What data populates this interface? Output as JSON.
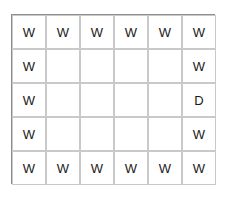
{
  "figure": {
    "background_color": "#ffffff",
    "frame": {
      "border_color": "#8e8e8e",
      "x": 11,
      "y": 14,
      "width": 204,
      "height": 170
    },
    "grid": {
      "columns": 6,
      "rows": 5,
      "cell_width": 34,
      "cell_height": 34,
      "line_color": "#c9c9c9"
    },
    "cells": [
      {
        "row": 0,
        "col": 0,
        "label": "W"
      },
      {
        "row": 0,
        "col": 1,
        "label": "W"
      },
      {
        "row": 0,
        "col": 2,
        "label": "W"
      },
      {
        "row": 0,
        "col": 3,
        "label": "W"
      },
      {
        "row": 0,
        "col": 4,
        "label": "W"
      },
      {
        "row": 0,
        "col": 5,
        "label": "W"
      },
      {
        "row": 1,
        "col": 0,
        "label": "W"
      },
      {
        "row": 1,
        "col": 1,
        "label": ""
      },
      {
        "row": 1,
        "col": 2,
        "label": ""
      },
      {
        "row": 1,
        "col": 3,
        "label": ""
      },
      {
        "row": 1,
        "col": 4,
        "label": ""
      },
      {
        "row": 1,
        "col": 5,
        "label": "W"
      },
      {
        "row": 2,
        "col": 0,
        "label": "W"
      },
      {
        "row": 2,
        "col": 1,
        "label": ""
      },
      {
        "row": 2,
        "col": 2,
        "label": ""
      },
      {
        "row": 2,
        "col": 3,
        "label": ""
      },
      {
        "row": 2,
        "col": 4,
        "label": ""
      },
      {
        "row": 2,
        "col": 5,
        "label": "D"
      },
      {
        "row": 3,
        "col": 0,
        "label": "W"
      },
      {
        "row": 3,
        "col": 1,
        "label": ""
      },
      {
        "row": 3,
        "col": 2,
        "label": ""
      },
      {
        "row": 3,
        "col": 3,
        "label": ""
      },
      {
        "row": 3,
        "col": 4,
        "label": ""
      },
      {
        "row": 3,
        "col": 5,
        "label": "W"
      },
      {
        "row": 4,
        "col": 0,
        "label": "W"
      },
      {
        "row": 4,
        "col": 1,
        "label": "W"
      },
      {
        "row": 4,
        "col": 2,
        "label": "W"
      },
      {
        "row": 4,
        "col": 3,
        "label": "W"
      },
      {
        "row": 4,
        "col": 4,
        "label": "W"
      },
      {
        "row": 4,
        "col": 5,
        "label": "W"
      }
    ],
    "wedge": {
      "name": "gradient-wedge",
      "description": "left-pointing shaded wedge",
      "tip_x": 92,
      "tip_y": 99,
      "top_x": 181,
      "top_y": 46,
      "bottom_x": 181,
      "bottom_y": 152,
      "right_x": 181,
      "gradient_dark": "#000000",
      "gradient_light": "#d8d8d8"
    },
    "circle": {
      "name": "white-circle",
      "center_x": 164,
      "center_y": 99,
      "radius": 16,
      "fill_color": "#ffffff",
      "stroke_color": "#4a4a4a"
    }
  }
}
